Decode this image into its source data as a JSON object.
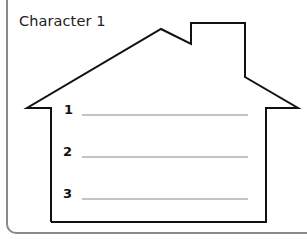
{
  "worksheet": {
    "title": "Character 1",
    "lines": [
      {
        "number": "1",
        "value": ""
      },
      {
        "number": "2",
        "value": ""
      },
      {
        "number": "3",
        "value": ""
      }
    ]
  },
  "colors": {
    "outline": "#111111",
    "frame": "#8a8a8a",
    "writing_line": "#888888"
  }
}
